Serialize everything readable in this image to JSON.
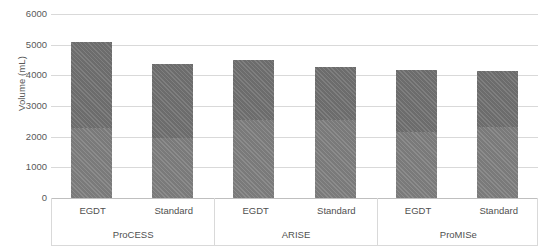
{
  "chart_data": {
    "type": "bar",
    "title": "",
    "subtitle": "",
    "xlabel": "",
    "ylabel": "Volume (mL)",
    "ylim": [
      0,
      6000
    ],
    "ytick_step": 1000,
    "yticks": [
      "6000",
      "5000",
      "4000",
      "3000",
      "2000",
      "1000",
      "0"
    ],
    "grid": true,
    "legend": "none",
    "stacked": true,
    "group_labels": [
      "ProCESS",
      "ARISE",
      "ProMISe"
    ],
    "categories": [
      "EGDT",
      "Standard",
      "EGDT",
      "Standard",
      "EGDT",
      "Standard"
    ],
    "series": [
      {
        "name": "Pre-randomisation fluid volume",
        "values": [
          2280,
          1960,
          2540,
          2540,
          2150,
          2310
        ]
      },
      {
        "name": "Post-randomisation fluid volume",
        "values": [
          2800,
          2410,
          1960,
          1730,
          2020,
          1830
        ]
      }
    ],
    "totals": [
      5080,
      4370,
      4500,
      4270,
      4170,
      4140
    ],
    "bars": [
      {
        "group": "ProCESS",
        "arm": "EGDT",
        "lower": 2280,
        "upper": 2800,
        "total": 5080
      },
      {
        "group": "ProCESS",
        "arm": "Standard",
        "lower": 1960,
        "upper": 2410,
        "total": 4370
      },
      {
        "group": "ARISE",
        "arm": "EGDT",
        "lower": 2540,
        "upper": 1960,
        "total": 4500
      },
      {
        "group": "ARISE",
        "arm": "Standard",
        "lower": 2540,
        "upper": 1730,
        "total": 4270
      },
      {
        "group": "ProMISe",
        "arm": "EGDT",
        "lower": 2150,
        "upper": 2020,
        "total": 4170
      },
      {
        "group": "ProMISe",
        "arm": "Standard",
        "lower": 2310,
        "upper": 1830,
        "total": 4140
      }
    ],
    "colors": {
      "segment_lower": "#7f7f7f",
      "segment_upper": "#737373",
      "gridline": "#d9d9d9",
      "axis": "#bfbfbf",
      "text": "#4f4f4f"
    }
  },
  "axis": {
    "y_title": "Volume (mL)",
    "y_ticks": [
      "6000",
      "5000",
      "4000",
      "3000",
      "2000",
      "1000",
      "0"
    ]
  },
  "groups": [
    {
      "label": "ProCESS",
      "arms": [
        "EGDT",
        "Standard"
      ]
    },
    {
      "label": "ARISE",
      "arms": [
        "EGDT",
        "Standard"
      ]
    },
    {
      "label": "ProMISe",
      "arms": [
        "EGDT",
        "Standard"
      ]
    }
  ]
}
